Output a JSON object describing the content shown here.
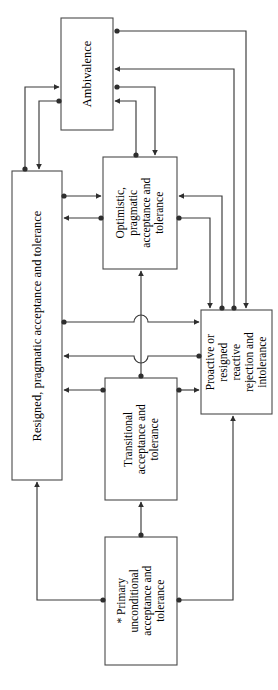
{
  "figure": {
    "type": "flow-diagram",
    "orientation": "rotated-90-ccw",
    "title": "",
    "background_color": "#ffffff",
    "line_color": "#3a3a3a",
    "text_color": "#000000"
  },
  "nodes": [
    {
      "id": "ambivalence",
      "label": "Ambivalence",
      "lines": [
        "Ambivalence"
      ],
      "x": 61,
      "y": 18,
      "w": 52,
      "h": 112
    },
    {
      "id": "resigned",
      "label": "Resigned, pragmatic acceptance and tolerance",
      "lines": [
        "Resigned, pragmatic acceptance and tolerance"
      ],
      "x": 12,
      "y": 171,
      "w": 50,
      "h": 309
    },
    {
      "id": "optimistic",
      "label": "Optimistic, pragmatic acceptance and tolerance",
      "lines": [
        "Optimistic,",
        "pragmatic",
        "acceptance and",
        "tolerance"
      ],
      "x": 103,
      "y": 157,
      "w": 74,
      "h": 112
    },
    {
      "id": "proactive",
      "label": "Proactive or resigned reactive rejection and intolerance",
      "lines": [
        "Proactive or",
        "resigned reactive",
        "rejection and",
        "intolerance"
      ],
      "x": 201,
      "y": 310,
      "w": 71,
      "h": 104
    },
    {
      "id": "transitional",
      "label": "Transitional acceptance and tolerance",
      "lines": [
        "Transitional",
        "acceptance and",
        "tolerance"
      ],
      "x": 105,
      "y": 378,
      "w": 72,
      "h": 122
    },
    {
      "id": "primary",
      "label": "* Primary unconditional acceptance and tolerance",
      "lines": [
        "* Primary",
        "unconditional",
        "acceptance and",
        "tolerance"
      ],
      "x": 105,
      "y": 537,
      "w": 72,
      "h": 128
    }
  ],
  "edges": [
    {
      "id": "e1",
      "from": "proactive",
      "to": "ambivalence",
      "style": "ball-to-arrow"
    },
    {
      "id": "e2",
      "from": "ambivalence",
      "to": "proactive",
      "style": "ball-to-arrow"
    },
    {
      "id": "e3",
      "from": "optimistic",
      "to": "ambivalence",
      "style": "ball-to-arrow"
    },
    {
      "id": "e4",
      "from": "ambivalence",
      "to": "optimistic",
      "style": "ball-to-arrow"
    },
    {
      "id": "e5",
      "from": "resigned",
      "to": "ambivalence",
      "style": "ball-to-arrow"
    },
    {
      "id": "e6",
      "from": "ambivalence",
      "to": "resigned",
      "style": "ball-to-arrow"
    },
    {
      "id": "e7",
      "from": "resigned",
      "to": "optimistic",
      "style": "ball-to-arrow"
    },
    {
      "id": "e8",
      "from": "optimistic",
      "to": "resigned",
      "style": "ball-to-arrow"
    },
    {
      "id": "e9",
      "from": "optimistic",
      "to": "proactive",
      "style": "ball-to-arrow"
    },
    {
      "id": "e10",
      "from": "proactive",
      "to": "optimistic",
      "style": "ball-to-arrow"
    },
    {
      "id": "e11",
      "from": "resigned",
      "to": "proactive",
      "style": "ball-to-arrow",
      "crossing": true
    },
    {
      "id": "e12",
      "from": "proactive",
      "to": "resigned",
      "style": "ball-to-arrow",
      "crossing": true
    },
    {
      "id": "e13",
      "from": "transitional",
      "to": "optimistic",
      "style": "ball-to-arrow"
    },
    {
      "id": "e14",
      "from": "transitional",
      "to": "resigned",
      "style": "ball-to-arrow"
    },
    {
      "id": "e15",
      "from": "transitional",
      "to": "proactive",
      "style": "ball-to-arrow"
    },
    {
      "id": "e16",
      "from": "primary",
      "to": "transitional",
      "style": "ball-to-arrow"
    },
    {
      "id": "e17",
      "from": "primary",
      "to": "resigned",
      "style": "ball-to-arrow"
    },
    {
      "id": "e18",
      "from": "primary",
      "to": "proactive",
      "style": "ball-to-arrow"
    }
  ],
  "footnote": ""
}
